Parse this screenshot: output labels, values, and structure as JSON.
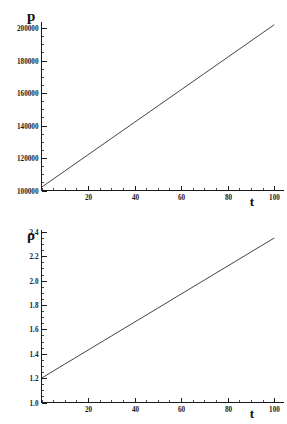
{
  "figure": {
    "background": "#ffffff",
    "line_color": "#2f2f33",
    "axis_color": "#1a1a1a",
    "panel_count": 2
  },
  "panels": [
    {
      "name": "pressure-panel",
      "ylabel": "p",
      "xlabel": "t"
    },
    {
      "name": "density-panel",
      "ylabel": "ρ",
      "xlabel": "t"
    }
  ],
  "chart_data": [
    {
      "type": "line",
      "title": "",
      "xlabel": "t",
      "ylabel": "p",
      "xlim": [
        0,
        104
      ],
      "ylim": [
        100000,
        204000
      ],
      "xticks": [
        20,
        40,
        60,
        80,
        100
      ],
      "xticklabels": [
        "20",
        "40",
        "60",
        "80",
        "100"
      ],
      "yticks": [
        100000,
        120000,
        140000,
        160000,
        180000,
        200000
      ],
      "yticklabels": [
        "100000",
        "120000",
        "140000",
        "160000",
        "180000",
        "200000"
      ],
      "xminor_step": 5,
      "yminor_step": 5000,
      "grid": false,
      "legend": "none",
      "series": [
        {
          "name": "p(t)",
          "color": "#2f2f33",
          "x": [
            0,
            10,
            20,
            30,
            40,
            50,
            60,
            70,
            80,
            90,
            100
          ],
          "values": [
            102000,
            112000,
            122000,
            132000,
            142000,
            152000,
            162000,
            172000,
            182000,
            192000,
            202000
          ]
        }
      ]
    },
    {
      "type": "line",
      "title": "",
      "xlabel": "t",
      "ylabel": "ρ",
      "xlim": [
        0,
        104
      ],
      "ylim": [
        1.0,
        2.42
      ],
      "xticks": [
        20,
        40,
        60,
        80,
        100
      ],
      "xticklabels": [
        "20",
        "40",
        "60",
        "80",
        "100"
      ],
      "yticks": [
        1.0,
        1.2,
        1.4,
        1.6,
        1.8,
        2.0,
        2.2,
        2.4
      ],
      "yticklabels": [
        "1.0",
        "1.2",
        "1.4",
        "1.6",
        "1.8",
        "2.0",
        "2.2",
        "2.4"
      ],
      "xminor_step": 5,
      "yminor_step": 0.05,
      "grid": false,
      "legend": "none",
      "series": [
        {
          "name": "rho(t)",
          "color": "#2f2f33",
          "x": [
            0,
            10,
            20,
            30,
            40,
            50,
            60,
            70,
            80,
            90,
            100
          ],
          "values": [
            1.2,
            1.315,
            1.43,
            1.545,
            1.66,
            1.775,
            1.89,
            2.005,
            2.12,
            2.235,
            2.35
          ]
        }
      ]
    }
  ]
}
